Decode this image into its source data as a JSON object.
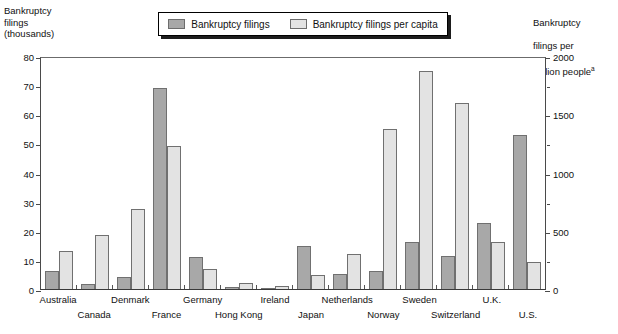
{
  "axis_left_caption": "Bankruptcy\nfilings\n(thousands)",
  "axis_right_caption_line1": "Bankruptcy",
  "axis_right_caption_line2": "filings per",
  "axis_right_caption_line3": "million people",
  "axis_right_superscript": "a",
  "legend": {
    "items": [
      {
        "label": "Bankruptcy filings",
        "color": "#a8a8a8",
        "swatch_name": "legend-swatch-filings"
      },
      {
        "label": "Bankruptcy filings per capita",
        "color": "#e3e3e3",
        "swatch_name": "legend-swatch-per-capita"
      }
    ]
  },
  "chart_data": {
    "type": "bar",
    "title": "",
    "xlabel": "",
    "ylabel": "Bankruptcy filings (thousands)",
    "ylabel_right": "Bankruptcy filings per million people",
    "ylim": [
      0,
      80
    ],
    "ylim_right": [
      0,
      2000
    ],
    "yticks": [
      0,
      10,
      20,
      30,
      40,
      50,
      60,
      70,
      80
    ],
    "yticks_right": [
      0,
      500,
      1000,
      1500,
      2000
    ],
    "yticks_right_minor": [
      250,
      750,
      1250,
      1750
    ],
    "grid": false,
    "legend_position": "top-center",
    "categories": [
      "Australia",
      "Canada",
      "Denmark",
      "France",
      "Germany",
      "Hong Kong",
      "Ireland",
      "Japan",
      "Netherlands",
      "Norway",
      "Sweden",
      "Switzerland",
      "U.K.",
      "U.S."
    ],
    "series": [
      {
        "name": "Bankruptcy filings",
        "axis": "left",
        "unit": "thousands",
        "color": "#a8a8a8",
        "values": [
          6.2,
          1.7,
          4.2,
          69.0,
          11.0,
          0.8,
          0.4,
          14.8,
          5.0,
          6.2,
          16.3,
          11.4,
          22.5,
          53.0
        ]
      },
      {
        "name": "Bankruptcy filings per capita",
        "axis": "right",
        "unit": "per million people",
        "color": "#e3e3e3",
        "values_left_scale": [
          13.2,
          18.4,
          27.6,
          49.2,
          7.0,
          2.2,
          1.1,
          4.8,
          12.0,
          55.0,
          75.0,
          63.7,
          16.0,
          9.3
        ],
        "values": [
          330,
          460,
          690,
          1230,
          175,
          55,
          28,
          120,
          300,
          1375,
          1875,
          1593,
          400,
          233
        ]
      }
    ]
  }
}
